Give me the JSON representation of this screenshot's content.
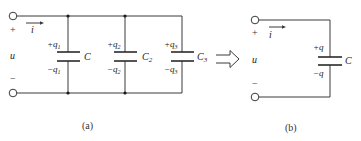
{
  "figure_a": {
    "caption": "(a)",
    "plus_sign": "+",
    "minus_sign": "−",
    "voltage": "u",
    "current": "i",
    "capacitors": [
      {
        "name": "C",
        "sub": "",
        "plus_charge": "+q",
        "plus_sub": "1",
        "minus_charge": "−q",
        "minus_sub": "1"
      },
      {
        "name": "C",
        "sub": "2",
        "plus_charge": "+q",
        "plus_sub": "2",
        "minus_charge": "−q",
        "minus_sub": "2"
      },
      {
        "name": "C",
        "sub": "3",
        "plus_charge": "+q",
        "plus_sub": "3",
        "minus_charge": "−q",
        "minus_sub": "3"
      }
    ]
  },
  "equivalence_arrow": "hollow-right-arrow",
  "figure_b": {
    "caption": "(b)",
    "plus_sign": "+",
    "minus_sign": "−",
    "voltage": "u",
    "current": "i",
    "capacitor": {
      "name": "C",
      "plus_charge": "+q",
      "minus_charge": "−q"
    }
  },
  "colors": {
    "line": "#3a3a3a",
    "text": "#222222",
    "background": "#ffffff"
  }
}
